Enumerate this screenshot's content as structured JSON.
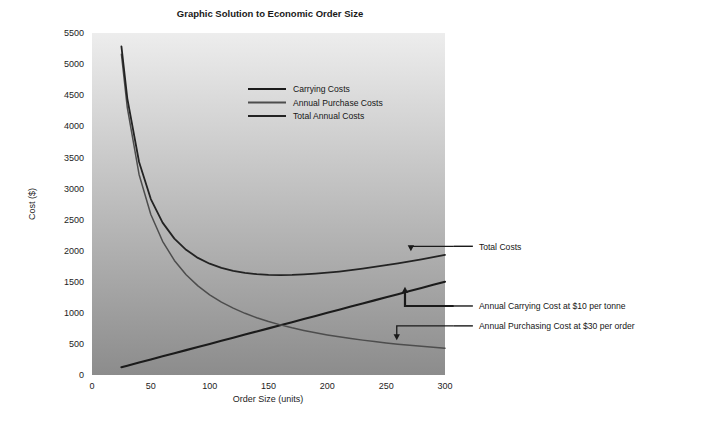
{
  "chart_data": {
    "type": "line",
    "title": "Graphic Solution to Economic Order Size",
    "xlabel": "Order Size (units)",
    "ylabel": "Cost ($)",
    "xlim": [
      0,
      300
    ],
    "ylim": [
      0,
      5500
    ],
    "xticks": [
      "0",
      "50",
      "100",
      "150",
      "200",
      "250",
      "300"
    ],
    "xtick_values": [
      0,
      50,
      100,
      150,
      200,
      250,
      300
    ],
    "yticks": [
      "0",
      "500",
      "1000",
      "1500",
      "2000",
      "2500",
      "3000",
      "3500",
      "4000",
      "4500",
      "5000",
      "5500"
    ],
    "ytick_values": [
      0,
      500,
      1000,
      1500,
      2000,
      2500,
      3000,
      3500,
      4000,
      4500,
      5000,
      5500
    ],
    "grid": false,
    "legend_position": "upper-center",
    "x": [
      25,
      30,
      40,
      50,
      60,
      70,
      80,
      90,
      100,
      110,
      120,
      130,
      140,
      150,
      160,
      170,
      180,
      190,
      200,
      210,
      220,
      230,
      240,
      250,
      260,
      270,
      280,
      290,
      300
    ],
    "series": [
      {
        "name": "Carrying Costs",
        "color": "#1b1b1b",
        "width": 2.1,
        "values": [
          125,
          150,
          200,
          250,
          300,
          350,
          400,
          450,
          500,
          550,
          600,
          650,
          700,
          750,
          800,
          850,
          900,
          950,
          1000,
          1050,
          1100,
          1150,
          1200,
          1250,
          1300,
          1350,
          1400,
          1450,
          1500
        ]
      },
      {
        "name": "Annual Purchase Costs",
        "color": "#4d4d4d",
        "width": 1.5,
        "values": [
          5160,
          4300,
          3225,
          2580,
          2150,
          1843,
          1613,
          1433,
          1290,
          1173,
          1075,
          992,
          921,
          860,
          806,
          759,
          717,
          679,
          645,
          614,
          586,
          561,
          538,
          516,
          496,
          478,
          461,
          445,
          430
        ]
      },
      {
        "name": "Total Annual Costs",
        "color": "#232323",
        "width": 1.8,
        "values": [
          5285,
          4450,
          3425,
          2830,
          2450,
          2193,
          2013,
          1883,
          1790,
          1723,
          1675,
          1642,
          1621,
          1610,
          1606,
          1609,
          1617,
          1629,
          1645,
          1664,
          1686,
          1711,
          1738,
          1766,
          1796,
          1828,
          1861,
          1895,
          1930
        ]
      }
    ],
    "annotations": [
      {
        "name": "total-costs",
        "text": "Total Costs",
        "target_x": 271,
        "target_y": 1990,
        "label_x": 305,
        "label_y": 2070
      },
      {
        "name": "annual-carrying-cost",
        "text": "Annual Carrying Cost at $10 per tonne",
        "target_x": 266,
        "target_y": 1420,
        "label_x": 305,
        "label_y": 1110
      },
      {
        "name": "annual-purchasing-cost",
        "text": "Annual Purchasing Cost at $30 per order",
        "target_x": 259,
        "target_y": 560,
        "label_x": 305,
        "label_y": 790
      }
    ],
    "plot_background": {
      "gradient_top": "#ededed",
      "gradient_bottom": "#8c8c8c"
    }
  }
}
